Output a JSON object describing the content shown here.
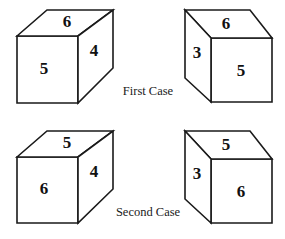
{
  "figure": {
    "background_color": "#ffffff",
    "line_color": "#1a1a1a",
    "text_color": "#111111"
  },
  "cases": [
    {
      "id": "first-case",
      "label": "First Case",
      "boxes": [
        {
          "id": "first-case-left-box",
          "orientation": "right-facing",
          "faces": {
            "top": "6",
            "front": "5",
            "side": "4"
          }
        },
        {
          "id": "first-case-right-box",
          "orientation": "left-facing",
          "faces": {
            "top": "6",
            "front": "5",
            "side": "3"
          }
        }
      ]
    },
    {
      "id": "second-case",
      "label": "Second Case",
      "boxes": [
        {
          "id": "second-case-left-box",
          "orientation": "right-facing",
          "faces": {
            "top": "5",
            "front": "6",
            "side": "4"
          }
        },
        {
          "id": "second-case-right-box",
          "orientation": "left-facing",
          "faces": {
            "top": "5",
            "front": "6",
            "side": "3"
          }
        }
      ]
    }
  ]
}
